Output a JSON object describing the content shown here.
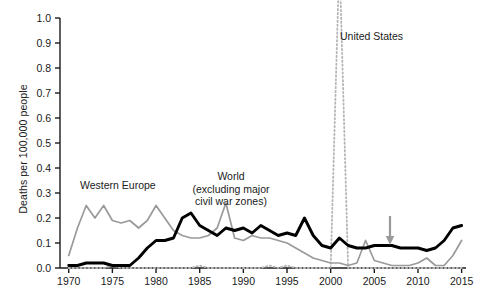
{
  "chart_data": {
    "type": "line",
    "title": "",
    "xlabel": "",
    "ylabel": "Deaths per 100,000 people",
    "xlim": [
      1969,
      2015.5
    ],
    "ylim": [
      0.0,
      1.0
    ],
    "grid": false,
    "legend_position": "inline-annotations",
    "xticks": [
      "1970",
      "1975",
      "1980",
      "1985",
      "1990",
      "1995",
      "2000",
      "2005",
      "2010",
      "2015"
    ],
    "yticks": [
      "0.0",
      "0.1",
      "0.2",
      "0.3",
      "0.4",
      "0.5",
      "0.6",
      "0.7",
      "0.8",
      "0.9",
      "1.0"
    ],
    "x": [
      1970,
      1971,
      1972,
      1973,
      1974,
      1975,
      1976,
      1977,
      1978,
      1979,
      1980,
      1981,
      1982,
      1983,
      1984,
      1985,
      1986,
      1987,
      1988,
      1989,
      1990,
      1991,
      1992,
      1993,
      1994,
      1995,
      1996,
      1997,
      1998,
      1999,
      2000,
      2001,
      2002,
      2003,
      2004,
      2005,
      2006,
      2007,
      2008,
      2009,
      2010,
      2011,
      2012,
      2013,
      2014,
      2015
    ],
    "series": [
      {
        "name": "Western Europe",
        "color": "#9a9a9a",
        "style": "solid",
        "values": [
          0.05,
          0.16,
          0.25,
          0.2,
          0.25,
          0.19,
          0.18,
          0.19,
          0.16,
          0.19,
          0.25,
          0.2,
          0.15,
          0.13,
          0.12,
          0.12,
          0.13,
          0.16,
          0.26,
          0.12,
          0.11,
          0.13,
          0.12,
          0.12,
          0.11,
          0.1,
          0.08,
          0.06,
          0.04,
          0.03,
          0.02,
          0.02,
          0.01,
          0.02,
          0.11,
          0.03,
          0.02,
          0.01,
          0.01,
          0.01,
          0.02,
          0.04,
          0.01,
          0.01,
          0.05,
          0.11
        ]
      },
      {
        "name": "World (excluding major civil war zones)",
        "color": "#000000",
        "style": "solid",
        "values": [
          0.01,
          0.01,
          0.02,
          0.02,
          0.02,
          0.01,
          0.01,
          0.01,
          0.04,
          0.08,
          0.11,
          0.11,
          0.12,
          0.2,
          0.22,
          0.17,
          0.15,
          0.13,
          0.16,
          0.15,
          0.16,
          0.14,
          0.17,
          0.15,
          0.13,
          0.14,
          0.13,
          0.2,
          0.13,
          0.09,
          0.08,
          0.12,
          0.09,
          0.08,
          0.08,
          0.09,
          0.09,
          0.09,
          0.08,
          0.08,
          0.08,
          0.07,
          0.08,
          0.11,
          0.16,
          0.17
        ]
      },
      {
        "name": "United States",
        "color": "#b5b5b5",
        "style": "dotted",
        "values": [
          0.0,
          0.0,
          0.0,
          0.0,
          0.0,
          0.01,
          0.0,
          0.0,
          0.0,
          0.0,
          0.0,
          0.0,
          0.0,
          0.0,
          0.0,
          0.01,
          0.0,
          0.0,
          0.0,
          0.0,
          0.0,
          0.0,
          0.0,
          0.01,
          0.0,
          0.01,
          0.0,
          0.0,
          0.0,
          0.0,
          0.0,
          1.25,
          0.0,
          0.0,
          0.0,
          0.0,
          0.0,
          0.0,
          0.0,
          0.0,
          0.0,
          0.0,
          0.0,
          0.0,
          0.0,
          0.0
        ],
        "note": "spike at 2001 extends above the top of the plotted axis"
      }
    ],
    "annotations": [
      {
        "id": "western-europe",
        "text": "Western Europe",
        "bold": false,
        "x_px": 80,
        "y_px": 179
      },
      {
        "id": "world",
        "line1": "World",
        "line2": "(excluding major",
        "line3": "civil war zones)",
        "bold_first_line": true,
        "x_px": 221,
        "y_px": 170
      },
      {
        "id": "united-states",
        "text": "United States",
        "bold": false,
        "x_px": 340,
        "y_px": 30
      },
      {
        "id": "arrow-2007",
        "text": "",
        "kind": "down-arrow",
        "x_px": 390,
        "y_px": 216
      }
    ]
  },
  "axis": {
    "y_title": "Deaths per 100,000 people"
  },
  "colors": {
    "western_europe": "#9a9a9a",
    "world": "#000000",
    "united_states": "#b5b5b5",
    "axis": "#1a1a1a",
    "arrow": "#9a9a9a",
    "background": "#ffffff"
  },
  "caption": {
    "text": ""
  }
}
